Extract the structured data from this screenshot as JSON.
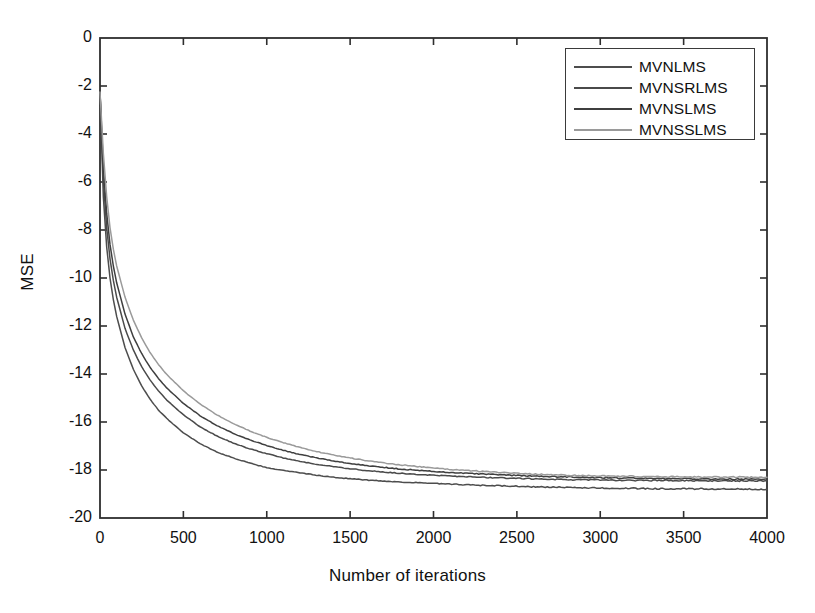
{
  "chart_data": {
    "type": "line",
    "title": "",
    "xlabel": "Number of iterations",
    "ylabel": "MSE",
    "xlim": [
      0,
      4000
    ],
    "ylim": [
      -20,
      0
    ],
    "xticks": [
      0,
      500,
      1000,
      1500,
      2000,
      2500,
      3000,
      3500,
      4000
    ],
    "xtick_labels": [
      "0",
      "500",
      "1000",
      "1500",
      "2000",
      "2500",
      "3000",
      "3500",
      "4000"
    ],
    "yticks": [
      0,
      -2,
      -4,
      -6,
      -8,
      -10,
      -12,
      -14,
      -16,
      -18,
      -20
    ],
    "ytick_labels": [
      "0",
      "-2",
      "-4",
      "-6",
      "-8",
      "-10",
      "-12",
      "-14",
      "-16",
      "-18",
      "-20"
    ],
    "grid": false,
    "box": true,
    "tick_direction": "in",
    "legend_position": "upper right",
    "series": [
      {
        "name": "MVNLMS",
        "color": "#4d4d4d",
        "final_value": -18.8,
        "x": [
          0,
          20,
          40,
          60,
          80,
          100,
          150,
          200,
          250,
          300,
          350,
          400,
          500,
          600,
          700,
          800,
          900,
          1000,
          1100,
          1200,
          1300,
          1400,
          1500,
          1600,
          1800,
          2000,
          2200,
          2400,
          2600,
          2800,
          3000,
          3200,
          3400,
          3600,
          3800,
          4000
        ],
        "y": [
          -2.25,
          -6.6,
          -8.7,
          -10.0,
          -10.9,
          -11.6,
          -12.9,
          -13.8,
          -14.5,
          -15.05,
          -15.5,
          -15.85,
          -16.45,
          -16.9,
          -17.25,
          -17.5,
          -17.72,
          -17.9,
          -18.02,
          -18.12,
          -18.22,
          -18.3,
          -18.36,
          -18.42,
          -18.5,
          -18.56,
          -18.62,
          -18.66,
          -18.7,
          -18.73,
          -18.75,
          -18.77,
          -18.78,
          -18.79,
          -18.8,
          -18.8
        ]
      },
      {
        "name": "MVNSRLMS",
        "color": "#4a4a4a",
        "final_value": -18.45,
        "x": [
          0,
          20,
          40,
          60,
          80,
          100,
          150,
          200,
          250,
          300,
          350,
          400,
          500,
          600,
          700,
          800,
          900,
          1000,
          1100,
          1200,
          1300,
          1400,
          1500,
          1600,
          1800,
          2000,
          2200,
          2400,
          2600,
          2800,
          3000,
          3200,
          3400,
          3600,
          3800,
          4000
        ],
        "y": [
          -2.25,
          -5.9,
          -7.9,
          -9.2,
          -10.1,
          -10.8,
          -12.1,
          -13.0,
          -13.7,
          -14.25,
          -14.7,
          -15.08,
          -15.7,
          -16.2,
          -16.58,
          -16.88,
          -17.12,
          -17.32,
          -17.5,
          -17.64,
          -17.76,
          -17.86,
          -17.95,
          -18.02,
          -18.14,
          -18.22,
          -18.28,
          -18.33,
          -18.37,
          -18.4,
          -18.42,
          -18.43,
          -18.44,
          -18.45,
          -18.45,
          -18.45
        ]
      },
      {
        "name": "MVNSLMS",
        "color": "#3f3f3f",
        "final_value": -18.38,
        "x": [
          0,
          20,
          40,
          60,
          80,
          100,
          150,
          200,
          250,
          300,
          350,
          400,
          500,
          600,
          700,
          800,
          900,
          1000,
          1100,
          1200,
          1300,
          1400,
          1500,
          1600,
          1800,
          2000,
          2200,
          2400,
          2600,
          2800,
          3000,
          3200,
          3400,
          3600,
          3800,
          4000
        ],
        "y": [
          -2.25,
          -5.4,
          -7.3,
          -8.6,
          -9.5,
          -10.2,
          -11.5,
          -12.45,
          -13.15,
          -13.72,
          -14.18,
          -14.58,
          -15.22,
          -15.74,
          -16.15,
          -16.48,
          -16.75,
          -16.98,
          -17.18,
          -17.35,
          -17.5,
          -17.62,
          -17.73,
          -17.82,
          -17.96,
          -18.06,
          -18.14,
          -18.2,
          -18.25,
          -18.29,
          -18.32,
          -18.34,
          -18.36,
          -18.37,
          -18.38,
          -18.38
        ]
      },
      {
        "name": "MVNSSLMS",
        "color": "#9a9a9a",
        "final_value": -18.3,
        "x": [
          0,
          20,
          40,
          60,
          80,
          100,
          150,
          200,
          250,
          300,
          350,
          400,
          500,
          600,
          700,
          800,
          900,
          1000,
          1100,
          1200,
          1300,
          1400,
          1500,
          1600,
          1800,
          2000,
          2200,
          2400,
          2600,
          2800,
          3000,
          3200,
          3400,
          3600,
          3800,
          4000
        ],
        "y": [
          -2.25,
          -4.8,
          -6.6,
          -7.9,
          -8.8,
          -9.5,
          -10.8,
          -11.75,
          -12.5,
          -13.1,
          -13.6,
          -14.02,
          -14.7,
          -15.25,
          -15.7,
          -16.07,
          -16.38,
          -16.64,
          -16.86,
          -17.06,
          -17.23,
          -17.38,
          -17.5,
          -17.61,
          -17.79,
          -17.92,
          -18.02,
          -18.1,
          -18.17,
          -18.22,
          -18.25,
          -18.27,
          -18.28,
          -18.29,
          -18.3,
          -18.3
        ]
      }
    ]
  },
  "legend": {
    "entries": [
      {
        "label": "MVNLMS"
      },
      {
        "label": "MVNSRLMS"
      },
      {
        "label": "MVNSLMS"
      },
      {
        "label": "MVNSSLMS"
      }
    ]
  }
}
